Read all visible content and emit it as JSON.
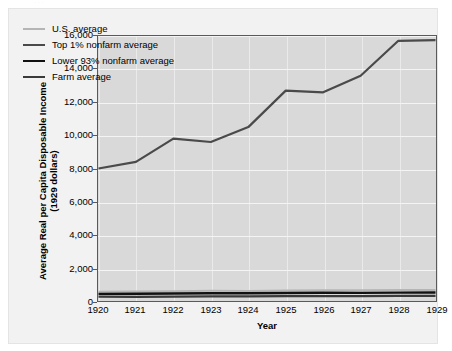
{
  "figure": {
    "top_cut_text": "· · ·",
    "background_color": "#f2f2f2",
    "plot_background_color": "#d9d9d9",
    "frame_color": "#5a5a5a",
    "gridline_color": "#f4f4f4"
  },
  "chart_data": {
    "type": "line",
    "title": "",
    "xlabel": "Year",
    "ylabel": "Average Real per Capita Disposable Income\n(1929 dollars)",
    "ylabel_line1": "Average Real per Capita Disposable Income",
    "ylabel_line2": "(1929 dollars)",
    "x": [
      1920,
      1921,
      1922,
      1923,
      1924,
      1925,
      1926,
      1927,
      1928,
      1929
    ],
    "categories": [
      "1920",
      "1921",
      "1922",
      "1923",
      "1924",
      "1925",
      "1926",
      "1927",
      "1928",
      "1929"
    ],
    "xlim": [
      1920,
      1929
    ],
    "ylim": [
      0,
      16000
    ],
    "yticks": [
      0,
      2000,
      4000,
      6000,
      8000,
      10000,
      12000,
      14000,
      16000
    ],
    "ytick_labels": [
      "0",
      "2,000",
      "4,000",
      "6,000",
      "8,000",
      "10,000",
      "12,000",
      "14,000",
      "16,000"
    ],
    "grid": true,
    "legend_position": "upper-left-inside",
    "series": [
      {
        "name": "U.S. average",
        "color": "#b5b5b5",
        "width": 2.0,
        "values": [
          560,
          570,
          590,
          620,
          610,
          640,
          650,
          645,
          660,
          665
        ]
      },
      {
        "name": "Top 1% nonfarm average",
        "color": "#4a4a4a",
        "width": 2.2,
        "values": [
          8000,
          8400,
          9800,
          9600,
          10500,
          12700,
          12600,
          13600,
          15700,
          15750
        ]
      },
      {
        "name": "Lower 93% nonfarm average",
        "color": "#111111",
        "width": 2.4,
        "values": [
          430,
          440,
          450,
          470,
          465,
          485,
          495,
          490,
          505,
          510
        ]
      },
      {
        "name": "Farm average",
        "color": "#3a3a3a",
        "width": 2.2,
        "values": [
          260,
          250,
          265,
          280,
          275,
          295,
          300,
          295,
          305,
          310
        ]
      }
    ]
  }
}
